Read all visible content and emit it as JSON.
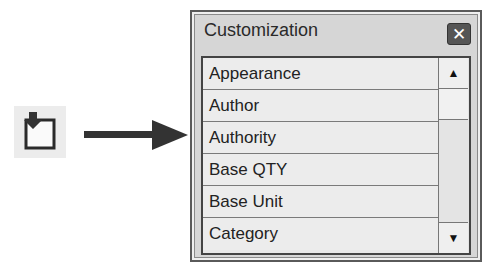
{
  "panel": {
    "title": "Customization",
    "close_label": "✕",
    "items": [
      {
        "label": "Appearance"
      },
      {
        "label": "Author"
      },
      {
        "label": "Authority"
      },
      {
        "label": "Base QTY"
      },
      {
        "label": "Base Unit"
      },
      {
        "label": "Category"
      }
    ],
    "scroll_up": "▲",
    "scroll_down": "▼"
  },
  "icons": {
    "tool": "customization-tool-icon",
    "arrow": "right-arrow-icon"
  }
}
